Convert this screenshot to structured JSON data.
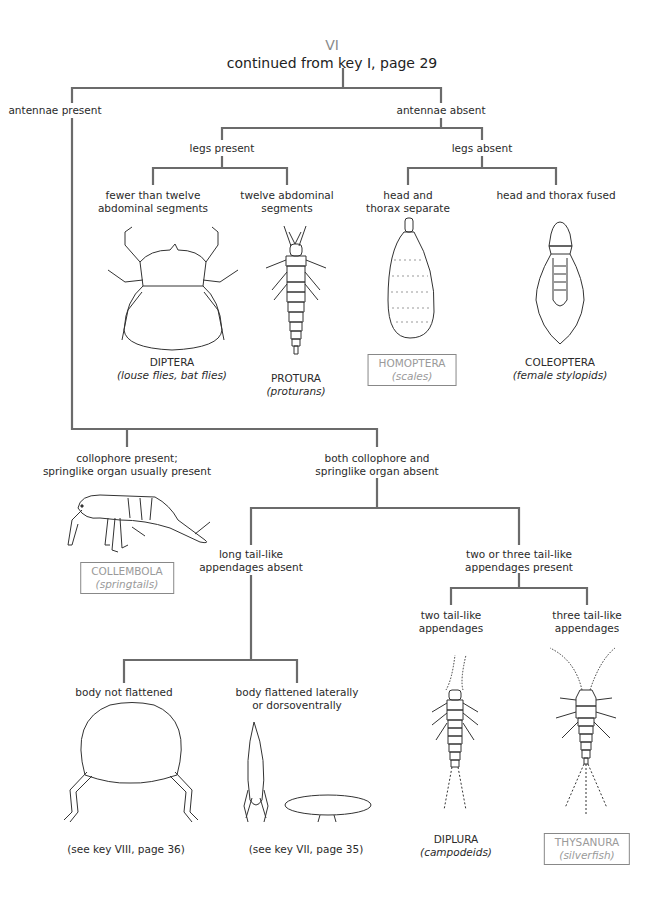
{
  "header": {
    "roman_numeral": "VI",
    "title": "continued from key I, page 29"
  },
  "colors": {
    "line": "#6b6b6b",
    "text": "#2a2a2a",
    "highlight_box": "#888888",
    "highlight_text": "#9a9a9a"
  },
  "nodes": {
    "antennae_present": "antennae present",
    "antennae_absent": "antennae absent",
    "legs_present": "legs present",
    "legs_absent": "legs absent",
    "fewer_than_twelve_1": "fewer than twelve",
    "fewer_than_twelve_2": "abdominal segments",
    "twelve_abdominal_1": "twelve abdominal",
    "twelve_abdominal_2": "segments",
    "head_thorax_separate_1": "head and",
    "head_thorax_separate_2": "thorax separate",
    "head_thorax_fused": "head and thorax fused",
    "collophore_present_1": "collophore present;",
    "collophore_present_2": "springlike organ usually present",
    "both_absent_1": "both collophore and",
    "both_absent_2": "springlike organ absent",
    "long_tail_absent_1": "long tail-like",
    "long_tail_absent_2": "appendages absent",
    "two_three_tail_1": "two or three tail-like",
    "two_three_tail_2": "appendages present",
    "two_tail_1": "two tail-like",
    "two_tail_2": "appendages",
    "three_tail_1": "three tail-like",
    "three_tail_2": "appendages",
    "body_not_flattened": "body not flattened",
    "body_flattened_1": "body flattened laterally",
    "body_flattened_2": "or dorsoventrally"
  },
  "taxa": {
    "diptera": {
      "name": "DIPTERA",
      "common": "(louse flies, bat flies)",
      "boxed": false
    },
    "protura": {
      "name": "PROTURA",
      "common": "(proturans)",
      "boxed": false
    },
    "homoptera": {
      "name": "HOMOPTERA",
      "common": "(scales)",
      "boxed": true
    },
    "coleoptera": {
      "name": "COLEOPTERA",
      "common": "(female stylopids)",
      "boxed": false
    },
    "collembola": {
      "name": "COLLEMBOLA",
      "common": "(springtails)",
      "boxed": true
    },
    "diplura": {
      "name": "DIPLURA",
      "common": "(campodeids)",
      "boxed": false
    },
    "thysanura": {
      "name": "THYSANURA",
      "common": "(silverfish)",
      "boxed": true
    }
  },
  "references": {
    "key_viii": "(see key VIII, page 36)",
    "key_vii": "(see key VII, page 35)"
  }
}
